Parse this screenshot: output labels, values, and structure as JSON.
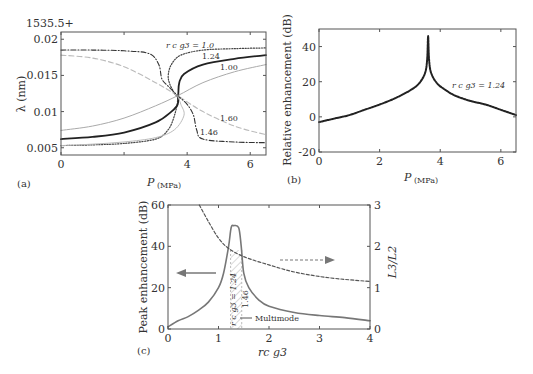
{
  "chart_data": [
    {
      "panel": "(a)",
      "type": "line",
      "title": "",
      "offset_label": "1535.5+",
      "xlabel": "P",
      "xlabel_sub": "(MPa)",
      "ylabel": "λ (nm)",
      "xlim": [
        0,
        6.5
      ],
      "ylim": [
        0.004,
        0.021
      ],
      "xticks": [
        0,
        2,
        4,
        6
      ],
      "xtick_labels": [
        "0",
        "",
        "4",
        "6"
      ],
      "yticks": [
        0.005,
        0.01,
        0.015,
        0.02
      ],
      "ytick_labels": [
        "0.005",
        "0.01",
        "0.015",
        "0.02"
      ],
      "series": [
        {
          "name": "r_c g_3 = 1.0",
          "style": "dotted",
          "color": "#444444",
          "x": [
            0,
            1,
            2,
            3,
            3.4,
            3.6,
            3.7,
            3.6,
            3.45,
            3.4,
            3.5,
            3.8,
            4.5,
            5.5,
            6.5
          ],
          "y": [
            0.0053,
            0.0054,
            0.0056,
            0.0062,
            0.0075,
            0.0095,
            0.0117,
            0.0125,
            0.0138,
            0.015,
            0.0165,
            0.0178,
            0.0185,
            0.0187,
            0.0188
          ]
        },
        {
          "name": "1.24",
          "style": "solid-bold",
          "color": "#222222",
          "x": [
            0,
            1,
            2,
            3,
            3.5,
            3.7,
            3.72,
            3.75,
            3.9,
            4.5,
            5.5,
            6.5
          ],
          "y": [
            0.0062,
            0.0065,
            0.0071,
            0.0085,
            0.01,
            0.011,
            0.0125,
            0.014,
            0.0152,
            0.0165,
            0.0173,
            0.0178
          ]
        },
        {
          "name": "1.00",
          "style": "solid-light",
          "color": "#aaaaaa",
          "x": [
            0,
            1,
            2,
            3,
            3.7,
            4.5,
            5.5,
            6.5
          ],
          "y": [
            0.0074,
            0.008,
            0.0091,
            0.0108,
            0.0122,
            0.014,
            0.0155,
            0.0165
          ]
        },
        {
          "name": "1.60",
          "style": "dashed-light",
          "color": "#bbbbbb",
          "x": [
            0,
            1,
            2,
            3,
            3.7,
            4.5,
            5.5,
            6.5
          ],
          "y": [
            0.0178,
            0.0174,
            0.0162,
            0.014,
            0.0122,
            0.01,
            0.008,
            0.0068
          ]
        },
        {
          "name": "1.46",
          "style": "dash-dot",
          "color": "#333333",
          "x": [
            0,
            1,
            2,
            2.8,
            3.1,
            3.2,
            3.4,
            3.7,
            4.0,
            4.2,
            4.3,
            4.5,
            5.5,
            6.5
          ],
          "y": [
            0.0185,
            0.0185,
            0.0184,
            0.018,
            0.0165,
            0.0145,
            0.0135,
            0.0122,
            0.011,
            0.0095,
            0.0075,
            0.0062,
            0.0058,
            0.0057
          ]
        },
        {
          "name": "1.0 (turnaround, light)",
          "style": "solid-light",
          "color": "#bbbbbb",
          "x": [
            0,
            1,
            2,
            3,
            3.6,
            3.9,
            3.8,
            3.7
          ],
          "y": [
            0.0053,
            0.0055,
            0.0058,
            0.0064,
            0.0075,
            0.0095,
            0.011,
            0.0122
          ]
        }
      ],
      "annotations": [
        "r_c g_3 = 1.0",
        "1.24",
        "1.00",
        "1.60",
        "1.46"
      ]
    },
    {
      "panel": "(b)",
      "type": "line",
      "title": "",
      "xlabel": "P",
      "xlabel_sub": "(MPa)",
      "ylabel": "Relative enhancement (dB)",
      "xlim": [
        0,
        6.5
      ],
      "ylim": [
        -20,
        50
      ],
      "xticks": [
        0,
        2,
        4,
        6
      ],
      "yticks": [
        -20,
        0,
        20,
        40
      ],
      "series": [
        {
          "name": "r_c g_3 = 1.24",
          "style": "dotted-bold",
          "color": "#222222",
          "x": [
            0,
            0.5,
            1,
            1.5,
            2,
            2.5,
            3,
            3.3,
            3.5,
            3.57,
            3.6,
            3.63,
            3.7,
            3.9,
            4.2,
            4.5,
            5,
            5.5,
            6,
            6.5
          ],
          "y": [
            -3,
            -1,
            1,
            4,
            7,
            10.5,
            15,
            19,
            25,
            33,
            46,
            33,
            25,
            19,
            15,
            12,
            9,
            7,
            4,
            1
          ]
        }
      ],
      "annotations": [
        "r_c g_3 = 1.24"
      ]
    },
    {
      "panel": "(c)",
      "type": "line",
      "title": "",
      "xlabel": "r_c g_3",
      "ylabel": "Peak enhancement (dB)",
      "ylabel_right": "L_3/L_2",
      "xlim": [
        0,
        4
      ],
      "ylim": [
        0,
        60
      ],
      "ylim_right": [
        0,
        3
      ],
      "xticks": [
        0,
        1,
        2,
        3,
        4
      ],
      "yticks": [
        0,
        20,
        40,
        60
      ],
      "yticks_right": [
        0,
        1,
        2,
        3
      ],
      "shaded_region": [
        1.24,
        1.46
      ],
      "shaded_label": "Multimode",
      "series": [
        {
          "name": "Peak enhancement",
          "axis": "left",
          "style": "solid",
          "color": "#777777",
          "x": [
            0,
            0.2,
            0.4,
            0.6,
            0.8,
            1.0,
            1.1,
            1.2,
            1.25,
            1.3,
            1.4,
            1.45,
            1.5,
            1.6,
            1.8,
            2.0,
            2.5,
            3.0,
            3.5,
            4.0
          ],
          "y": [
            1,
            4,
            6,
            9,
            13,
            20,
            27,
            40,
            49,
            50,
            49,
            40,
            27,
            20,
            14,
            11,
            8,
            6.5,
            5.5,
            4
          ]
        },
        {
          "name": "L3/L2",
          "axis": "right",
          "style": "dashed",
          "color": "#555555",
          "x": [
            0.62,
            0.8,
            1.0,
            1.2,
            1.5,
            2.0,
            2.5,
            3.0,
            3.5,
            4.0
          ],
          "y": [
            3.0,
            2.6,
            2.2,
            1.95,
            1.75,
            1.55,
            1.38,
            1.27,
            1.2,
            1.15
          ]
        }
      ],
      "annotations": [
        "r_c g_3 = 1.24",
        "1.46",
        "Multimode"
      ]
    }
  ],
  "labels": {
    "a": "(a)",
    "b": "(b)",
    "c": "(c)",
    "offset": "1535.5+",
    "a_ylabel": "λ (nm)",
    "b_ylabel": "Relative enhancement (dB)",
    "c_ylabel": "Peak enhancement (dB)",
    "c_ylabel_right": "L3/L2",
    "p_label": "P",
    "p_unit": "(MPa)",
    "rg_label": "rc g3",
    "ann_a_10": "r c g3 = 1.0",
    "ann_a_124": "1.24",
    "ann_a_100": "1.00",
    "ann_a_160": "1.60",
    "ann_a_146": "1.46",
    "ann_b": "r c g3 = 1.24",
    "ann_c_124": "r c g3 = 1.24",
    "ann_c_146": "1.46",
    "ann_c_multimode": "Multimode"
  }
}
